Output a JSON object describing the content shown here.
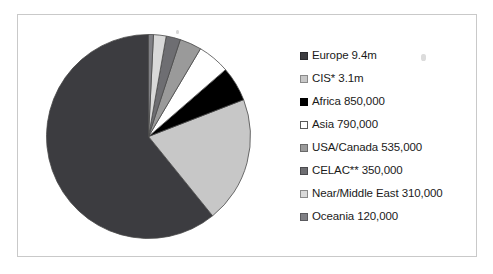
{
  "chart_data": {
    "type": "pie",
    "title": "",
    "categories": [
      "Europe",
      "CIS*",
      "Africa",
      "Asia",
      "USA/Canada",
      "CELAC**",
      "Near/Middle East",
      "Oceania"
    ],
    "values": [
      9400000,
      3100000,
      850000,
      790000,
      535000,
      350000,
      310000,
      120000
    ],
    "value_labels": [
      "9.4m",
      "3.1m",
      "850,000",
      "790,000",
      "535,000",
      "350,000",
      "310,000",
      "120,000"
    ],
    "percentages": [
      59.9,
      19.8,
      5.4,
      5.0,
      3.4,
      2.2,
      2.0,
      0.8
    ],
    "colors": [
      "#3c3c40",
      "#c7c7c7",
      "#000000",
      "#ffffff",
      "#9a9a9a",
      "#6e6e72",
      "#d9d9d9",
      "#808085"
    ],
    "legend_position": "right",
    "grid": false,
    "start_angle_deg": 0,
    "direction": "clockwise"
  },
  "legend": {
    "items": [
      {
        "label": "Europe 9.4m",
        "swatch_name": "legend-swatch-europe",
        "color": "#3c3c40",
        "border": "#2a2a2e"
      },
      {
        "label": "CIS* 3.1m",
        "swatch_name": "legend-swatch-cis",
        "color": "#c7c7c7",
        "border": "#8a8a8a"
      },
      {
        "label": "Africa 850,000",
        "swatch_name": "legend-swatch-africa",
        "color": "#000000",
        "border": "#000000"
      },
      {
        "label": "Asia 790,000",
        "swatch_name": "legend-swatch-asia",
        "color": "#ffffff",
        "border": "#5a5a5a"
      },
      {
        "label": "USA/Canada 535,000",
        "swatch_name": "legend-swatch-usa-canada",
        "color": "#9a9a9a",
        "border": "#6a6a6a"
      },
      {
        "label": "CELAC** 350,000",
        "swatch_name": "legend-swatch-celac",
        "color": "#6e6e72",
        "border": "#4a4a4e"
      },
      {
        "label": "Near/Middle East 310,000",
        "swatch_name": "legend-swatch-near-middle-east",
        "color": "#d9d9d9",
        "border": "#8a8a8a"
      },
      {
        "label": "Oceania 120,000",
        "swatch_name": "legend-swatch-oceania",
        "color": "#808085",
        "border": "#5a5a5e"
      }
    ]
  }
}
